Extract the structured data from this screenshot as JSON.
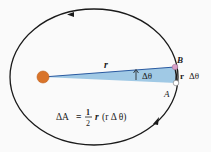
{
  "diagram": {
    "labels": {
      "radius": "r",
      "angle": "Δθ",
      "point_b": "B",
      "point_a": "A",
      "arc_length_r": "r",
      "arc_length_dtheta": "Δθ",
      "formula_lhs": "ΔA",
      "formula_eq": "=",
      "formula_num": "1",
      "formula_den": "2",
      "formula_r": "r",
      "formula_paren": "(r Δ θ)"
    },
    "colors": {
      "background": "#fafafa",
      "orbit": "#1a1a1a",
      "sun": "#d9742a",
      "sun_stroke": "#c0601c",
      "wedge_fill": "#8fbfe0",
      "radius_line": "#2a5aa0",
      "point_b": "#d8a0c8",
      "point_a": "#ffffff"
    },
    "geometry": {
      "orbit_center": [
        94,
        77
      ],
      "orbit_rx": 84,
      "orbit_ry": 68,
      "sun_center": [
        43,
        77
      ],
      "sun_radius": 6,
      "point_b": [
        175,
        67
      ],
      "point_a": [
        176,
        83
      ]
    }
  }
}
